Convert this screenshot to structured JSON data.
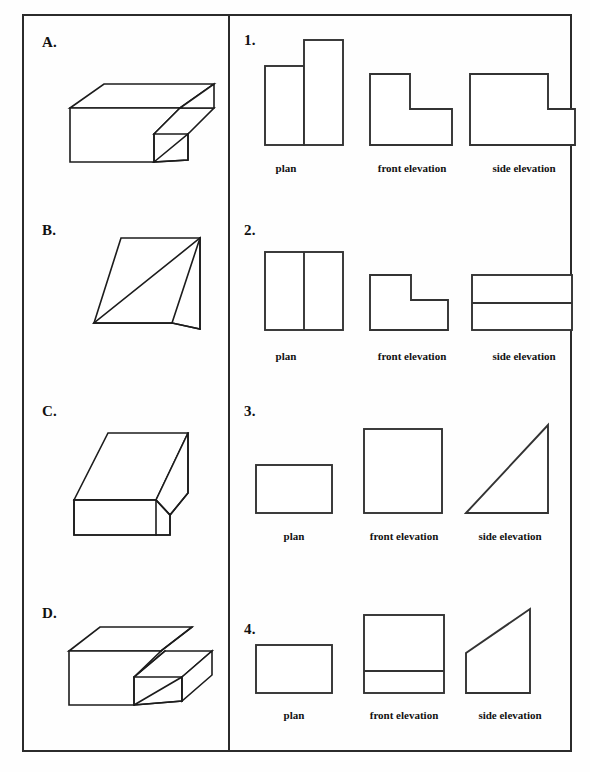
{
  "worksheet": {
    "title": "Orthographic Projection Matching Exercise",
    "frame_color": "#2b2b2b",
    "line_color": "#1c1c1c",
    "background": "#ffffff"
  },
  "view_labels": {
    "plan": "plan",
    "front_elevation": "front elevation",
    "side_elevation": "side elevation"
  },
  "solids": [
    {
      "label": "A.",
      "name": "stepped-block-two-tier",
      "description": "Isometric stepped block: lower front slab with a raised rear step"
    },
    {
      "label": "B.",
      "name": "wedge-ramp",
      "description": "Isometric wedge with a single large sloping face rising to the right"
    },
    {
      "label": "C.",
      "name": "wedge-on-base",
      "description": "Isometric wedge seated on a rectangular plinth base"
    },
    {
      "label": "D.",
      "name": "notched-stepped-block",
      "description": "Isometric stepped block with a central notch channel"
    }
  ],
  "projection_sets": [
    {
      "label": "1.",
      "name": "projection-set-1",
      "plan": "two adjoining rectangles of unequal height",
      "front_elevation": "L-shape with step down on the right",
      "side_elevation": "L-shape, upper block left over full-width lower block"
    },
    {
      "label": "2.",
      "name": "projection-set-2",
      "plan": "square divided by a vertical centre line",
      "front_elevation": "L-shape with notch cut at top right",
      "side_elevation": "rectangle divided by a horizontal line"
    },
    {
      "label": "3.",
      "name": "projection-set-3",
      "plan": "plain rectangle",
      "front_elevation": "plain square",
      "side_elevation": "right-angled triangle rising to the right"
    },
    {
      "label": "4.",
      "name": "projection-set-4",
      "plan": "plain rectangle",
      "front_elevation": "rectangle divided by a horizontal line near the base",
      "side_elevation": "trapezoid with sloping top rising to the right"
    }
  ]
}
